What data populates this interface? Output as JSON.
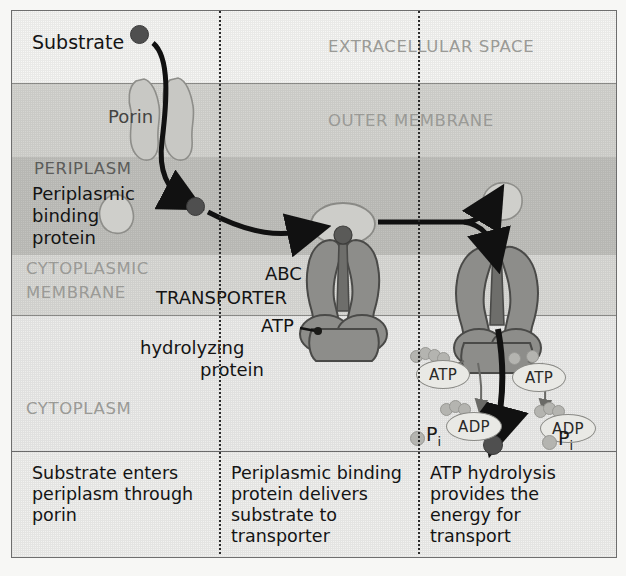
{
  "diagram": {
    "bands": [
      {
        "id": "extracellular",
        "label": "EXTRACELLULAR SPACE",
        "color": "#f7f7f5"
      },
      {
        "id": "outer_membrane",
        "label": "OUTER MEMBRANE",
        "color": "#d6d6d2"
      },
      {
        "id": "periplasm",
        "label": "PERIPLASM",
        "color": "#c2c2be"
      },
      {
        "id": "cytoplasmic_membrane",
        "label_line1": "CYTOPLASMIC",
        "label_line2": "MEMBRANE",
        "color": "#dcdcd8"
      },
      {
        "id": "cytoplasm",
        "label": "CYTOPLASM",
        "color": "#eeeeec"
      }
    ],
    "annotations": {
      "substrate": "Substrate",
      "porin": "Porin",
      "periplasmic_binding_protein_line1": "Periplasmic",
      "periplasmic_binding_protein_line2": "binding",
      "periplasmic_binding_protein_line3": "protein",
      "abc_line1": "ABC",
      "abc_line2": "TRANSPORTER",
      "atp_protein_line1": "ATP",
      "atp_protein_line2": "hydrolyzing",
      "atp_protein_line3": "protein"
    },
    "molecules": {
      "atp": "ATP",
      "adp": "ADP",
      "phosphate": "P",
      "phosphate_subscript": "i"
    },
    "captions": [
      {
        "id": "step1",
        "line1": "Substrate enters",
        "line2": "periplasm through",
        "line3": "porin"
      },
      {
        "id": "step2",
        "line1": "Periplasmic binding",
        "line2": "protein delivers",
        "line3": "substrate to",
        "line4": "transporter"
      },
      {
        "id": "step3",
        "line1": "ATP hydrolysis",
        "line2": "provides the",
        "line3": "energy for",
        "line4": "transport"
      }
    ],
    "watermark": {
      "line1": "RESISTANCE OF BACTERIA TO ANTIBIOTICS",
      "line2": "The bacterial cytoplasmic",
      "line3": "membrane is a selective",
      "line4": "barrier for excretion and",
      "line5": "uptake of substrates"
    },
    "colors": {
      "protein_fill": "#8d8d8a",
      "protein_stroke": "#4a4a48",
      "substrate_dot": "#4f4f4f",
      "arrow": "#111111",
      "band_label": "#9a9a96",
      "text": "#141414"
    }
  }
}
